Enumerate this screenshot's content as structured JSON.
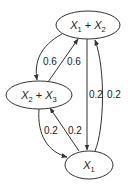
{
  "diagram": {
    "type": "state-transition-graph",
    "nodes": [
      {
        "id": "n_top",
        "var1": "X",
        "sub1": "1",
        "op": " + ",
        "var2": "X",
        "sub2": "2"
      },
      {
        "id": "n_mid",
        "var1": "X",
        "sub1": "2",
        "op": " + ",
        "var2": "X",
        "sub2": "3"
      },
      {
        "id": "n_bot",
        "var1": "X",
        "sub1": "1"
      }
    ],
    "edges": [
      {
        "from": "X1 + X2",
        "to": "X2 + X3",
        "label": "0.6"
      },
      {
        "from": "X2 + X3",
        "to": "X1 + X2",
        "label": "0.6"
      },
      {
        "from": "X1 + X2",
        "to": "X1",
        "label": "0.2"
      },
      {
        "from": "X1",
        "to": "X1 + X2",
        "label": "0.2"
      },
      {
        "from": "X2 + X3",
        "to": "X1",
        "label": "0.2"
      },
      {
        "from": "X1",
        "to": "X2 + X3",
        "label": "0.2"
      }
    ],
    "colors": {
      "stroke": "#333333",
      "text": "#222222",
      "background": "#ffffff"
    }
  }
}
